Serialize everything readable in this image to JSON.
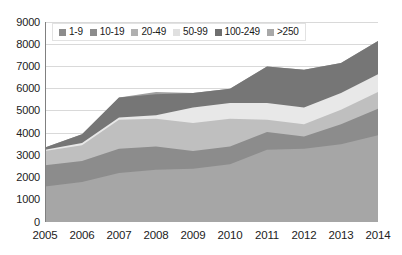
{
  "chart_data": {
    "type": "area",
    "title": "",
    "subtitle": "",
    "xlabel": "",
    "ylabel": "",
    "stacked": true,
    "grid": true,
    "legend_position": "top-center",
    "categories": [
      "2005",
      "2006",
      "2007",
      "2008",
      "2009",
      "2010",
      "2011",
      "2012",
      "2013",
      "2014"
    ],
    "x": [
      2005,
      2006,
      2007,
      2008,
      2009,
      2010,
      2011,
      2012,
      2013,
      2014
    ],
    "xlim": [
      2005,
      2014
    ],
    "ylim": [
      0,
      9000
    ],
    "ytick_values": [
      0,
      1000,
      2000,
      3000,
      4000,
      5000,
      6000,
      7000,
      8000,
      9000
    ],
    "ytick_labels": [
      "0",
      "1000",
      "2000",
      "3000",
      "4000",
      "5000",
      "6000",
      "7000",
      "8000",
      "9000"
    ],
    "xtick_labels": [
      "2005",
      "2006",
      "2007",
      "2008",
      "2009",
      "2010",
      "2011",
      "2012",
      "2013",
      "2014"
    ],
    "series": [
      {
        "name": "1-9",
        "color": "#a6a6a6",
        "values": [
          1600,
          1800,
          2200,
          2350,
          2400,
          2600,
          3250,
          3300,
          3500,
          3900
        ]
      },
      {
        "name": "10-19",
        "color": "#8c8c8c",
        "values": [
          950,
          950,
          1100,
          1050,
          800,
          800,
          800,
          550,
          900,
          1200
        ]
      },
      {
        "name": "20-49",
        "color": "#bfbfbf",
        "values": [
          650,
          700,
          1300,
          1250,
          1250,
          1250,
          550,
          550,
          650,
          750
        ]
      },
      {
        "name": "50-99",
        "color": "#e8e8e8",
        "values": [
          50,
          100,
          100,
          150,
          700,
          700,
          750,
          750,
          750,
          800
        ]
      },
      {
        "name": "100-249",
        "color": "#767676",
        "values": [
          100,
          400,
          900,
          950,
          650,
          650,
          1650,
          1700,
          1350,
          1500
        ]
      },
      {
        "name": ">250",
        "color": "#a0a0a0",
        "values": [
          0,
          0,
          0,
          100,
          0,
          0,
          0,
          0,
          0,
          0
        ]
      }
    ],
    "cumulative_tops": {
      "1-9": [
        1600,
        1800,
        2200,
        2350,
        2400,
        2600,
        3250,
        3300,
        3500,
        3900
      ],
      "10-19": [
        2550,
        2750,
        3300,
        3400,
        3200,
        3400,
        4050,
        3850,
        4400,
        5100
      ],
      "20-49": [
        3200,
        3450,
        4600,
        4650,
        4450,
        4650,
        4600,
        4400,
        5050,
        5850
      ],
      "50-99": [
        3250,
        3550,
        4700,
        4800,
        5150,
        5350,
        5350,
        5150,
        5800,
        6650
      ],
      "100-249": [
        3350,
        3950,
        5600,
        5750,
        5800,
        6000,
        7000,
        6850,
        7150,
        8150
      ],
      ">250": [
        3350,
        3950,
        5600,
        5750,
        5800,
        6000,
        7000,
        6850,
        7150,
        8150
      ]
    }
  },
  "legend": {
    "items": [
      {
        "label": "1-9",
        "color": "#8c8c8c"
      },
      {
        "label": "10-19",
        "color": "#8c8c8c"
      },
      {
        "label": "20-49",
        "color": "#b0b0b0"
      },
      {
        "label": "50-99",
        "color": "#e0e0e0"
      },
      {
        "label": "100-249",
        "color": "#6f6f6f"
      },
      {
        "label": ">250",
        "color": "#a8a8a8"
      }
    ]
  },
  "axes": {
    "y_labels": [
      "9000",
      "8000",
      "7000",
      "6000",
      "5000",
      "4000",
      "3000",
      "2000",
      "1000",
      "0"
    ],
    "x_labels": [
      "2005",
      "2006",
      "2007",
      "2008",
      "2009",
      "2010",
      "2011",
      "2012",
      "2013",
      "2014"
    ]
  },
  "style": {
    "background": "#ffffff",
    "gridline_color": "#d9d9d9",
    "axis_line_color": "#808080",
    "text_color": "#222222"
  }
}
